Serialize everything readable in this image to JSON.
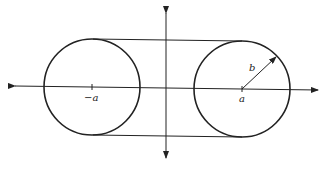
{
  "diagram": {
    "type": "geometric-figure",
    "colors": {
      "stroke": "#222222",
      "background": "#ffffff"
    },
    "labels": {
      "left_center": "−a",
      "right_center": "a",
      "radius": "b"
    },
    "geometry": {
      "left_circle": {
        "cx": 92,
        "cy": 87,
        "r": 48
      },
      "right_circle": {
        "cx": 242,
        "cy": 89,
        "r": 48
      },
      "x_axis": {
        "x1": 15,
        "y1": 86,
        "x2": 318,
        "y2": 90
      },
      "y_axis": {
        "x1": 166,
        "y1": 13,
        "x2": 166,
        "y2": 158
      },
      "top_tangent": {
        "x1": 93,
        "y1": 39,
        "x2": 242,
        "y2": 41
      },
      "bottom_tangent": {
        "x1": 93,
        "y1": 135,
        "x2": 242,
        "y2": 137
      },
      "radius_arrow": {
        "x1": 242,
        "y1": 89,
        "x2": 276,
        "y2": 57
      }
    }
  }
}
